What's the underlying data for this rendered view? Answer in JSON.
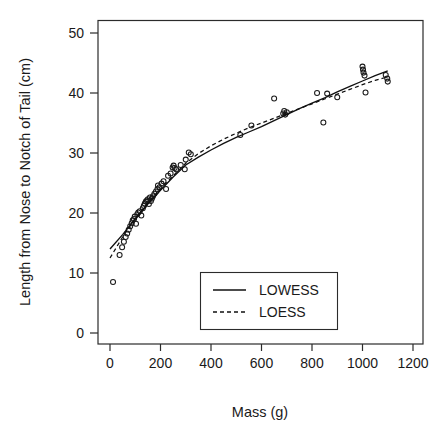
{
  "chart_data": {
    "type": "scatter",
    "title": "",
    "xlabel": "Mass (g)",
    "ylabel": "Length from Nose to Notch of Tail (cm)",
    "xlim": [
      -30,
      1260
    ],
    "ylim": [
      -2,
      52
    ],
    "xticks": [
      0,
      200,
      400,
      600,
      800,
      1000,
      1200
    ],
    "xtick_labels": [
      "0",
      "200",
      "400",
      "600",
      "800",
      "1000",
      "1200"
    ],
    "yticks": [
      0,
      10,
      20,
      30,
      40,
      50
    ],
    "ytick_labels": [
      "0",
      "10",
      "20",
      "30",
      "40",
      "50"
    ],
    "grid": false,
    "legend_position": "lower center",
    "marker": "open-circle",
    "points": [
      [
        12,
        8.5
      ],
      [
        38,
        13.0
      ],
      [
        48,
        14.3
      ],
      [
        55,
        15.2
      ],
      [
        62,
        16.0
      ],
      [
        68,
        16.6
      ],
      [
        74,
        17.2
      ],
      [
        80,
        17.8
      ],
      [
        86,
        18.3
      ],
      [
        90,
        18.8
      ],
      [
        95,
        19.0
      ],
      [
        98,
        19.4
      ],
      [
        103,
        18.2
      ],
      [
        108,
        19.8
      ],
      [
        112,
        20.1
      ],
      [
        118,
        20.3
      ],
      [
        124,
        19.6
      ],
      [
        130,
        20.8
      ],
      [
        134,
        21.2
      ],
      [
        138,
        21.6
      ],
      [
        142,
        21.9
      ],
      [
        146,
        22.1
      ],
      [
        150,
        22.3
      ],
      [
        154,
        21.5
      ],
      [
        158,
        22.6
      ],
      [
        162,
        22.0
      ],
      [
        166,
        22.4
      ],
      [
        170,
        22.8
      ],
      [
        176,
        23.2
      ],
      [
        182,
        23.6
      ],
      [
        188,
        24.0
      ],
      [
        190,
        24.6
      ],
      [
        196,
        24.3
      ],
      [
        204,
        24.9
      ],
      [
        212,
        25.3
      ],
      [
        222,
        24.0
      ],
      [
        230,
        26.2
      ],
      [
        240,
        26.6
      ],
      [
        248,
        27.6
      ],
      [
        252,
        27.9
      ],
      [
        256,
        27.5
      ],
      [
        262,
        27.3
      ],
      [
        280,
        28.0
      ],
      [
        296,
        27.3
      ],
      [
        300,
        28.9
      ],
      [
        312,
        30.1
      ],
      [
        320,
        29.8
      ],
      [
        516,
        33.0
      ],
      [
        560,
        34.6
      ],
      [
        650,
        39.1
      ],
      [
        686,
        36.6
      ],
      [
        690,
        37.0
      ],
      [
        694,
        36.4
      ],
      [
        700,
        36.8
      ],
      [
        820,
        40.0
      ],
      [
        845,
        35.1
      ],
      [
        860,
        39.9
      ],
      [
        900,
        39.3
      ],
      [
        1000,
        44.4
      ],
      [
        1002,
        43.9
      ],
      [
        1004,
        43.4
      ],
      [
        1008,
        42.9
      ],
      [
        1012,
        40.1
      ],
      [
        1092,
        43.0
      ],
      [
        1098,
        42.4
      ],
      [
        1100,
        41.9
      ]
    ],
    "series": [
      {
        "name": "LOWESS",
        "style": "solid",
        "points": [
          [
            0,
            14.0
          ],
          [
            50,
            16.4
          ],
          [
            100,
            19.0
          ],
          [
            150,
            21.5
          ],
          [
            200,
            23.8
          ],
          [
            250,
            26.0
          ],
          [
            300,
            28.0
          ],
          [
            350,
            29.3
          ],
          [
            400,
            30.5
          ],
          [
            450,
            31.6
          ],
          [
            500,
            32.6
          ],
          [
            550,
            33.5
          ],
          [
            600,
            34.4
          ],
          [
            650,
            35.4
          ],
          [
            700,
            36.4
          ],
          [
            750,
            37.4
          ],
          [
            800,
            38.3
          ],
          [
            850,
            39.2
          ],
          [
            900,
            40.2
          ],
          [
            950,
            41.1
          ],
          [
            1000,
            42.0
          ],
          [
            1050,
            42.9
          ],
          [
            1100,
            43.7
          ]
        ]
      },
      {
        "name": "LOESS",
        "style": "dashed",
        "points": [
          [
            0,
            12.5
          ],
          [
            50,
            16.0
          ],
          [
            100,
            19.1
          ],
          [
            150,
            21.7
          ],
          [
            200,
            24.0
          ],
          [
            250,
            26.2
          ],
          [
            300,
            28.3
          ],
          [
            350,
            29.9
          ],
          [
            400,
            31.2
          ],
          [
            450,
            32.3
          ],
          [
            500,
            33.3
          ],
          [
            550,
            34.2
          ],
          [
            600,
            35.0
          ],
          [
            650,
            35.8
          ],
          [
            700,
            36.6
          ],
          [
            750,
            37.4
          ],
          [
            800,
            38.2
          ],
          [
            850,
            39.0
          ],
          [
            900,
            39.8
          ],
          [
            950,
            40.6
          ],
          [
            1000,
            41.4
          ],
          [
            1050,
            42.1
          ],
          [
            1100,
            42.7
          ]
        ]
      }
    ],
    "legend": [
      {
        "label": "LOWESS",
        "style": "solid"
      },
      {
        "label": "LOESS",
        "style": "dashed"
      }
    ]
  }
}
